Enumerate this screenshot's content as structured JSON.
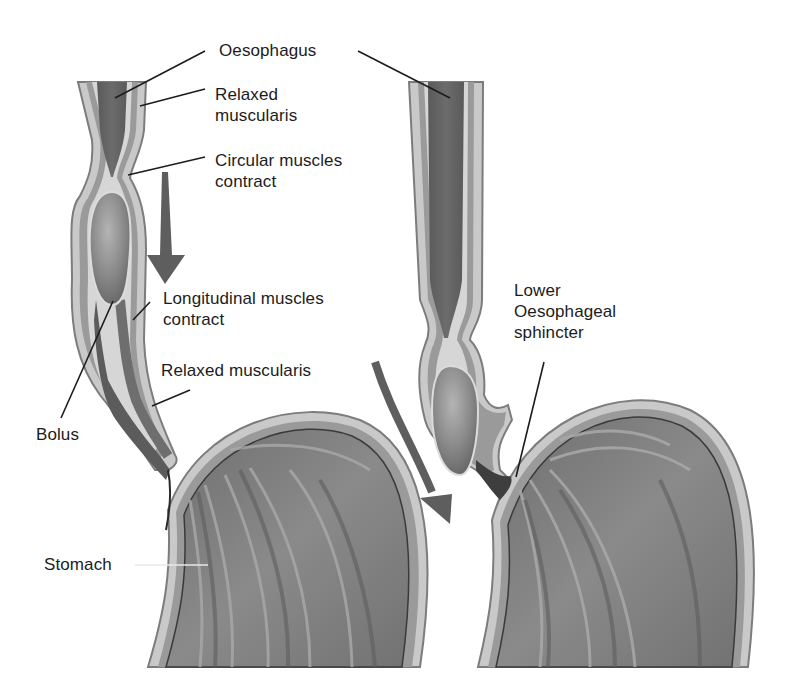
{
  "diagram": {
    "colors": {
      "background": "#ffffff",
      "lumen_dark": "#5a5a5a",
      "mucosa": "#6e6e6e",
      "muscularis_light": "#c9c9c9",
      "muscularis_mid": "#9a9a9a",
      "wall_edge": "#7c7c7c",
      "bolus": "#8a8a8a",
      "bolus_highlight": "#b4b4b4",
      "stomach_interior": "#7d7d7d",
      "rugae_light": "#a9a9a9",
      "arrow": "#5e5e5e",
      "text": "#1c1c1c",
      "leader": "#1c1c1c"
    },
    "panels": [
      {
        "id": "left-panel",
        "description": "Bolus being propelled down the oesophagus",
        "labels": [
          {
            "id": "oesophagus",
            "lines": [
              "Oesophagus"
            ],
            "x": 219,
            "y": 40
          },
          {
            "id": "relaxed-muscularis-top",
            "lines": [
              "Relaxed",
              "muscularis"
            ],
            "x": 215,
            "y": 84
          },
          {
            "id": "circular-muscles-contract",
            "lines": [
              "Circular muscles",
              "contract"
            ],
            "x": 215,
            "y": 150
          },
          {
            "id": "longitudinal-muscles-contract",
            "lines": [
              "Longitudinal muscles",
              "contract"
            ],
            "x": 163,
            "y": 288
          },
          {
            "id": "relaxed-muscularis-bottom",
            "lines": [
              "Relaxed muscularis"
            ],
            "x": 161,
            "y": 360
          },
          {
            "id": "bolus",
            "lines": [
              "Bolus"
            ],
            "x": 36,
            "y": 424
          },
          {
            "id": "stomach",
            "lines": [
              "Stomach"
            ],
            "x": 44,
            "y": 554
          }
        ],
        "leaders": [
          {
            "for": "oesophagus",
            "x1": 205,
            "y1": 51,
            "x2": 115,
            "y2": 98
          },
          {
            "for": "relaxed-muscularis-top",
            "x1": 205,
            "y1": 89,
            "x2": 140,
            "y2": 106
          },
          {
            "for": "circular-muscles-contract",
            "x1": 205,
            "y1": 157,
            "x2": 128,
            "y2": 175
          },
          {
            "for": "longitudinal-muscles-contract",
            "x1": 150,
            "y1": 302,
            "x2": 133,
            "y2": 320
          },
          {
            "for": "relaxed-muscularis-bottom",
            "x1": 190,
            "y1": 390,
            "x2": 152,
            "y2": 406
          },
          {
            "for": "bolus",
            "x1": 61,
            "y1": 418,
            "x2": 113,
            "y2": 301
          },
          {
            "for": "stomach",
            "x1": 135,
            "y1": 565,
            "x2": 208,
            "y2": 565
          }
        ]
      },
      {
        "id": "right-panel",
        "description": "Bolus passing the lower oesophageal sphincter into the stomach",
        "labels": [
          {
            "id": "lower-oesophageal-sphincter",
            "lines": [
              "Lower",
              "Oesophageal",
              "sphincter"
            ],
            "x": 514,
            "y": 280
          }
        ],
        "leaders": [
          {
            "for": "oesophagus",
            "x1": 358,
            "y1": 51,
            "x2": 450,
            "y2": 98
          },
          {
            "for": "lower-oesophageal-sphincter",
            "x1": 544,
            "y1": 362,
            "x2": 516,
            "y2": 477
          }
        ]
      }
    ],
    "arrows": [
      {
        "id": "downward-peristalsis-arrow",
        "direction": "down"
      },
      {
        "id": "diagonal-progression-arrow",
        "direction": "down-right"
      }
    ]
  }
}
